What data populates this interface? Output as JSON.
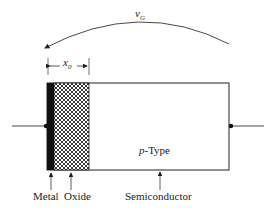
{
  "diagram": {
    "voltage_label": "v",
    "voltage_sub": "G",
    "thickness_label": "x",
    "thickness_sub": "0",
    "region_label_italic": "p",
    "region_label_rest": "-Type",
    "labels": {
      "metal": "Metal",
      "oxide": "Oxide",
      "semiconductor": "Semiconductor"
    }
  }
}
